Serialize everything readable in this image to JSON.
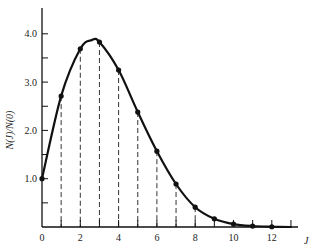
{
  "chart_data": {
    "type": "line",
    "title": "",
    "xlabel": "J",
    "ylabel": "N(J)/N(0)",
    "xlim": [
      0,
      13
    ],
    "ylim": [
      0,
      4.5
    ],
    "grid": false,
    "legend": null,
    "x_ticks": [
      0,
      1,
      2,
      3,
      4,
      5,
      6,
      7,
      8,
      9,
      10,
      11,
      12,
      13
    ],
    "x_tick_labels": [
      "0",
      "2",
      "4",
      "6",
      "8",
      "10",
      "12"
    ],
    "x_tick_label_values": [
      0,
      2,
      4,
      6,
      8,
      10,
      12
    ],
    "y_major_ticks": [
      1.0,
      2.0,
      3.0,
      4.0
    ],
    "y_tick_labels": [
      "1.0",
      "2.0",
      "3.0",
      "4.0"
    ],
    "y_minor_ticks": [
      0.5,
      1.5,
      2.5,
      3.5
    ],
    "series": [
      {
        "name": "N(J)/N(0)",
        "style": "smooth curve with point markers and dashed drop lines",
        "x": [
          0,
          1,
          2,
          3,
          4,
          5,
          6,
          7,
          8,
          9,
          10,
          11,
          12
        ],
        "values": [
          1.0,
          2.71,
          3.69,
          3.83,
          3.25,
          2.38,
          1.57,
          0.89,
          0.41,
          0.17,
          0.06,
          0.02,
          0.005
        ]
      }
    ],
    "peak": {
      "x": 2.6,
      "y": 3.87
    }
  }
}
